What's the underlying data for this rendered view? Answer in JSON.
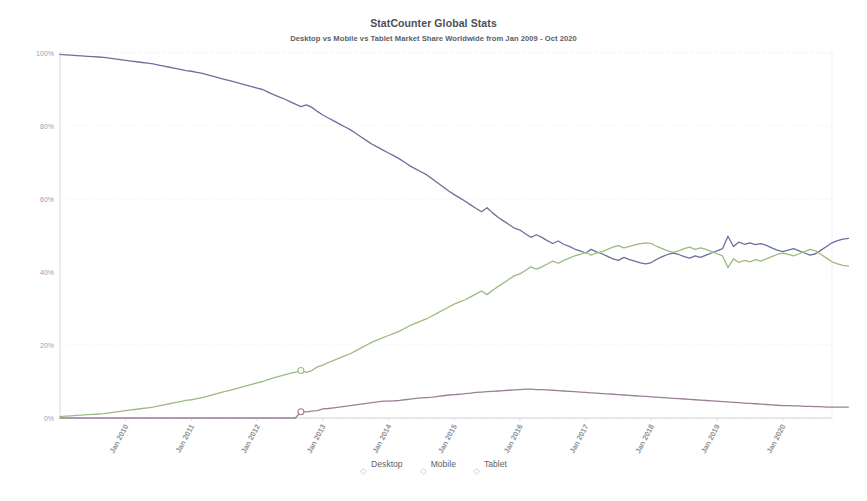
{
  "chart_data": {
    "type": "line",
    "title": "StatCounter Global Stats",
    "subtitle": "Desktop vs Mobile vs Tablet Market Share Worldwide from Jan 2009 - Oct 2020",
    "xlabel": "",
    "ylabel": "",
    "ylim": [
      0,
      100
    ],
    "y_ticks": [
      "0%",
      "20%",
      "40%",
      "60%",
      "80%",
      "100%"
    ],
    "y_tick_values": [
      0,
      20,
      40,
      60,
      80,
      100
    ],
    "x_ticks": [
      "Jan 2010",
      "Jan 2011",
      "Jan 2012",
      "Jan 2013",
      "Jan 2014",
      "Jan 2015",
      "Jan 2016",
      "Jan 2017",
      "Jan 2018",
      "Jan 2019",
      "Jan 2020"
    ],
    "x_tick_values": [
      12,
      24,
      36,
      48,
      60,
      72,
      84,
      96,
      108,
      120,
      132
    ],
    "x_range": [
      0,
      141
    ],
    "grid": true,
    "legend_position": "bottom",
    "colors": {
      "desktop": "#6b6f9e",
      "mobile": "#9dbb7e",
      "tablet": "#9b7f99",
      "grid": "#e8e8ef",
      "axis": "#d8d8e0",
      "text": "#8f939c"
    },
    "series": [
      {
        "name": "Desktop",
        "color": "#6b6f9e",
        "values": [
          99.6,
          99.5,
          99.4,
          99.3,
          99.2,
          99.1,
          99.0,
          98.9,
          98.8,
          98.6,
          98.4,
          98.2,
          98.0,
          97.8,
          97.6,
          97.4,
          97.2,
          97.0,
          96.7,
          96.4,
          96.1,
          95.8,
          95.5,
          95.2,
          95.0,
          94.7,
          94.4,
          94.0,
          93.6,
          93.2,
          92.8,
          92.4,
          92.0,
          91.6,
          91.2,
          90.8,
          90.4,
          90.0,
          89.3,
          88.6,
          88.0,
          87.4,
          86.7,
          86.0,
          85.3,
          85.8,
          85.1,
          84.0,
          83.0,
          82.2,
          81.4,
          80.6,
          79.8,
          79.0,
          78.0,
          77.0,
          76.0,
          75.0,
          74.2,
          73.4,
          72.6,
          71.8,
          71.0,
          70.0,
          69.0,
          68.2,
          67.4,
          66.6,
          65.5,
          64.4,
          63.3,
          62.2,
          61.2,
          60.3,
          59.4,
          58.4,
          57.4,
          56.5,
          57.6,
          56.2,
          55.0,
          54.0,
          53.0,
          52.0,
          51.5,
          50.5,
          49.5,
          50.2,
          49.5,
          48.6,
          47.8,
          48.5,
          47.6,
          47.0,
          46.3,
          45.8,
          45.2,
          46.2,
          45.5,
          45.0,
          44.3,
          43.6,
          43.2,
          44.0,
          43.4,
          43.0,
          42.5,
          42.2,
          42.6,
          43.5,
          44.2,
          44.8,
          45.2,
          44.8,
          44.2,
          43.8,
          44.4,
          44.0,
          44.6,
          45.2,
          45.8,
          46.4,
          49.8,
          47.0,
          48.2,
          47.6,
          48.0,
          47.5,
          47.8,
          47.3,
          46.6,
          46.0,
          45.6,
          46.0,
          46.4,
          45.8,
          45.2,
          44.6,
          45.0,
          46.0,
          47.0,
          48.0,
          48.6,
          49.0,
          49.2
        ]
      },
      {
        "name": "Mobile",
        "color": "#9dbb7e",
        "values": [
          0.4,
          0.5,
          0.6,
          0.7,
          0.8,
          0.9,
          1.0,
          1.1,
          1.2,
          1.4,
          1.6,
          1.8,
          2.0,
          2.2,
          2.4,
          2.6,
          2.8,
          3.0,
          3.3,
          3.6,
          3.9,
          4.2,
          4.5,
          4.8,
          5.0,
          5.3,
          5.6,
          6.0,
          6.4,
          6.8,
          7.2,
          7.6,
          8.0,
          8.4,
          8.8,
          9.2,
          9.6,
          10.0,
          10.5,
          11.0,
          11.4,
          11.8,
          12.2,
          12.6,
          13.0,
          12.5,
          13.0,
          14.0,
          14.5,
          15.2,
          15.8,
          16.4,
          17.0,
          17.6,
          18.4,
          19.2,
          20.0,
          20.8,
          21.4,
          22.0,
          22.6,
          23.2,
          23.8,
          24.6,
          25.4,
          26.0,
          26.6,
          27.2,
          28.0,
          28.8,
          29.6,
          30.4,
          31.2,
          31.8,
          32.4,
          33.2,
          34.0,
          34.8,
          33.8,
          35.0,
          36.0,
          37.0,
          38.0,
          39.0,
          39.5,
          40.4,
          41.4,
          40.8,
          41.4,
          42.2,
          43.0,
          42.4,
          43.2,
          43.8,
          44.4,
          44.8,
          45.4,
          44.6,
          45.2,
          45.6,
          46.2,
          46.8,
          47.2,
          46.6,
          47.0,
          47.4,
          47.8,
          48.0,
          47.8,
          47.0,
          46.4,
          45.8,
          45.4,
          45.8,
          46.4,
          46.8,
          46.2,
          46.6,
          46.2,
          45.6,
          45.0,
          44.4,
          41.2,
          43.6,
          42.6,
          43.2,
          42.8,
          43.4,
          43.0,
          43.6,
          44.2,
          44.8,
          45.2,
          44.8,
          44.4,
          45.0,
          45.6,
          46.2,
          45.8,
          44.8,
          43.8,
          42.8,
          42.2,
          41.8,
          41.6
        ]
      },
      {
        "name": "Tablet",
        "color": "#9b7f99",
        "values": [
          0.0,
          0.0,
          0.0,
          0.0,
          0.0,
          0.0,
          0.0,
          0.0,
          0.0,
          0.0,
          0.0,
          0.0,
          0.0,
          0.0,
          0.0,
          0.0,
          0.0,
          0.0,
          0.0,
          0.0,
          0.0,
          0.0,
          0.0,
          0.0,
          0.0,
          0.0,
          0.0,
          0.0,
          0.0,
          0.0,
          0.0,
          0.0,
          0.0,
          0.0,
          0.0,
          0.0,
          0.0,
          0.0,
          0.0,
          0.0,
          0.0,
          0.0,
          0.0,
          0.0,
          1.7,
          1.7,
          1.9,
          2.0,
          2.5,
          2.6,
          2.8,
          3.0,
          3.2,
          3.4,
          3.6,
          3.8,
          4.0,
          4.2,
          4.4,
          4.6,
          4.6,
          4.7,
          4.8,
          5.0,
          5.2,
          5.4,
          5.5,
          5.6,
          5.7,
          5.9,
          6.1,
          6.3,
          6.4,
          6.5,
          6.7,
          6.8,
          7.0,
          7.1,
          7.2,
          7.3,
          7.4,
          7.5,
          7.6,
          7.7,
          7.8,
          7.9,
          7.9,
          7.8,
          7.8,
          7.7,
          7.6,
          7.5,
          7.4,
          7.3,
          7.2,
          7.1,
          7.0,
          6.9,
          6.8,
          6.7,
          6.6,
          6.5,
          6.4,
          6.3,
          6.2,
          6.1,
          6.0,
          5.9,
          5.8,
          5.7,
          5.6,
          5.5,
          5.4,
          5.3,
          5.2,
          5.1,
          5.0,
          4.9,
          4.8,
          4.7,
          4.6,
          4.5,
          4.4,
          4.3,
          4.2,
          4.1,
          4.0,
          3.9,
          3.8,
          3.7,
          3.6,
          3.5,
          3.4,
          3.4,
          3.3,
          3.3,
          3.2,
          3.2,
          3.1,
          3.1,
          3.0,
          3.0,
          3.0,
          3.0,
          3.0
        ]
      }
    ],
    "markers": [
      {
        "series": "Mobile",
        "x_index": 44,
        "value": 13.0
      },
      {
        "series": "Tablet",
        "x_index": 44,
        "value": 1.7
      }
    ]
  },
  "legend": {
    "items": [
      {
        "label": "Desktop",
        "color": "#6b6f9e"
      },
      {
        "label": "Mobile",
        "color": "#9dbb7e"
      },
      {
        "label": "Tablet",
        "color": "#9b7f99"
      }
    ]
  }
}
